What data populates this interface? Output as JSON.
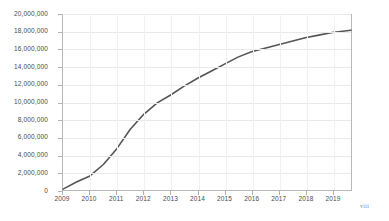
{
  "page": {
    "folio": "viii"
  },
  "chart_data": {
    "type": "line",
    "title": "",
    "subtitle": "",
    "xlabel": "",
    "ylabel": "",
    "grid": true,
    "legend": "none",
    "xlim": [
      2009,
      2019.7
    ],
    "ylim": [
      0,
      20000000
    ],
    "x_tick_labels": [
      "2009",
      "2010",
      "2011",
      "2012",
      "2013",
      "2014",
      "2015",
      "2016",
      "2017",
      "2018",
      "2019"
    ],
    "x_ticks": [
      2009,
      2010,
      2011,
      2012,
      2013,
      2014,
      2015,
      2016,
      2017,
      2018,
      2019
    ],
    "y_tick_labels": [
      "0",
      "2,000,000",
      "4,000,000",
      "6,000,000",
      "8,000,000",
      "10,000,000",
      "12,000,000",
      "14,000,000",
      "16,000,000",
      "18,000,000",
      "20,000,000"
    ],
    "y_ticks": [
      0,
      2000000,
      4000000,
      6000000,
      8000000,
      10000000,
      12000000,
      14000000,
      16000000,
      18000000,
      20000000
    ],
    "series": [
      {
        "name": "Cumulative total",
        "color": "#555555",
        "x": [
          2009,
          2009.5,
          2010,
          2010.5,
          2011,
          2011.5,
          2012,
          2012.5,
          2013,
          2013.5,
          2014,
          2014.5,
          2015,
          2015.5,
          2016,
          2016.5,
          2017,
          2017.5,
          2018,
          2018.5,
          2019,
          2019.7
        ],
        "values": [
          100000,
          900000,
          1600000,
          2900000,
          4700000,
          6900000,
          8600000,
          9900000,
          10800000,
          11800000,
          12700000,
          13500000,
          14300000,
          15100000,
          15700000,
          16100000,
          16500000,
          16900000,
          17300000,
          17600000,
          17900000,
          18150000
        ]
      }
    ]
  }
}
